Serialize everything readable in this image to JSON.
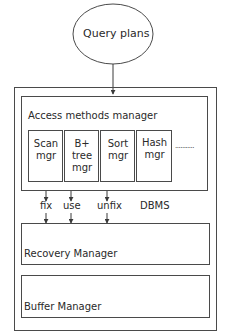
{
  "diagram": {
    "top_node": {
      "label": "Query plans",
      "shape": "ellipse"
    },
    "container": {
      "label": "DBMS"
    },
    "access_methods": {
      "title": "Access methods manager",
      "modules": [
        {
          "line1": "Scan",
          "line2": "mgr",
          "line3": ""
        },
        {
          "line1": "B+",
          "line2": "tree",
          "line3": "mgr"
        },
        {
          "line1": "Sort",
          "line2": "mgr",
          "line3": ""
        },
        {
          "line1": "Hash",
          "line2": "mgr",
          "line3": ""
        }
      ],
      "more": "..........."
    },
    "calls": [
      {
        "label": "fix"
      },
      {
        "label": "use"
      },
      {
        "label": "unfix"
      }
    ],
    "recovery": {
      "label": "Recovery Manager"
    },
    "buffer": {
      "label": "Buffer Manager"
    },
    "colors": {
      "stroke": "#4a4a4a",
      "text": "#2a2a2a",
      "background": "#ffffff"
    }
  }
}
